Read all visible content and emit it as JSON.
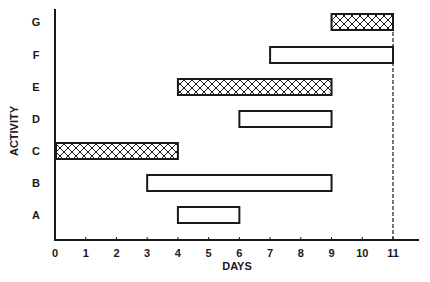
{
  "chart_data": {
    "type": "bar",
    "subtype": "gantt",
    "title": "",
    "xlabel": "DAYS",
    "ylabel": "ACTIVITY",
    "xlim": [
      0,
      11
    ],
    "x_ticks": [
      0,
      1,
      2,
      3,
      4,
      5,
      6,
      7,
      8,
      9,
      10,
      11
    ],
    "grid": false,
    "legend": null,
    "categories": [
      "A",
      "B",
      "C",
      "D",
      "E",
      "F",
      "G"
    ],
    "tasks": [
      {
        "activity": "A",
        "start": 4,
        "end": 6,
        "critical": false
      },
      {
        "activity": "B",
        "start": 3,
        "end": 9,
        "critical": false
      },
      {
        "activity": "C",
        "start": 0,
        "end": 4,
        "critical": true
      },
      {
        "activity": "D",
        "start": 6,
        "end": 9,
        "critical": false
      },
      {
        "activity": "E",
        "start": 4,
        "end": 9,
        "critical": true
      },
      {
        "activity": "F",
        "start": 7,
        "end": 11,
        "critical": false
      },
      {
        "activity": "G",
        "start": 9,
        "end": 11,
        "critical": true
      }
    ],
    "annotations": [
      {
        "type": "dashed-vertical-line",
        "x": 11
      }
    ],
    "styles": {
      "critical_fill": "crosshatch",
      "noncritical_fill": "#ffffff",
      "stroke": "#1a1a1a"
    }
  }
}
